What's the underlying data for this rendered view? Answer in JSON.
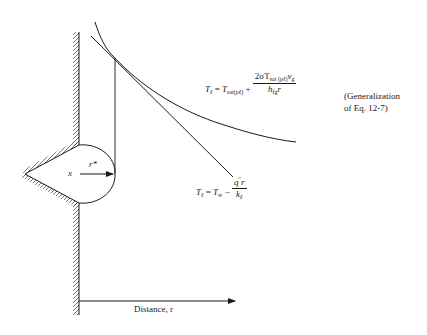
{
  "diagram": {
    "type": "bubble nucleation temperature profile near a wall cavity",
    "colors": {
      "line": "#1a1a1a",
      "background": "#ffffff"
    },
    "labels": {
      "cavity_center": "x",
      "radius_label": "r*",
      "axis_label": "Distance, r",
      "curve_equation": {
        "lhs": "T",
        "lhs_sub": "ℓ",
        "eq": "=",
        "term1": "T",
        "term1_sub": "sat(p",
        "term1_sub2": "ℓ",
        "term1_sub3": ")",
        "plus": "+",
        "num_prefix": "2σT",
        "num_sub": "sat (p",
        "num_sub2": "ℓ",
        "num_sub3": ")",
        "num_v": "v",
        "num_v_sub": "g",
        "den": "h",
        "den_sub": "fg",
        "den_r": "r"
      },
      "curve_note_line1": "(Generalization",
      "curve_note_line2": "of  Eq. 12-7)",
      "line_equation": {
        "lhs": "T",
        "lhs_sub": "ℓ",
        "eq": "=",
        "term1": "T",
        "term1_sub": "w",
        "minus": "−",
        "num": "q",
        "num_sup": "″",
        "num_r": "r",
        "den": "k",
        "den_sub": "ℓ"
      }
    }
  }
}
